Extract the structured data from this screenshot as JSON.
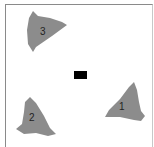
{
  "figure": {
    "caption_cropped": "",
    "center_marker": {
      "shape": "rectangle",
      "color": "#000000"
    },
    "shapes": [
      {
        "id": 1,
        "label": "1",
        "color": "#8c8c8c"
      },
      {
        "id": 2,
        "label": "2",
        "color": "#8c8c8c"
      },
      {
        "id": 3,
        "label": "3",
        "color": "#8c8c8c"
      }
    ]
  }
}
